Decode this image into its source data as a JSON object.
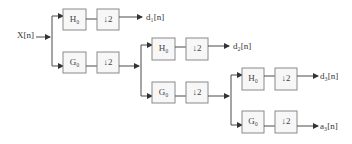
{
  "diagram": {
    "type": "three-level wavelet decomposition filter bank",
    "input": {
      "label": "X[n]"
    },
    "stages": [
      {
        "high": {
          "filter": "H₀",
          "downsample": "↓2",
          "output": "d₁[n]"
        },
        "low": {
          "filter": "G₀",
          "downsample": "↓2"
        }
      },
      {
        "high": {
          "filter": "H₀",
          "downsample": "↓2",
          "output": "d₂[n]"
        },
        "low": {
          "filter": "G₀",
          "downsample": "↓2"
        }
      },
      {
        "high": {
          "filter": "H₀",
          "downsample": "↓2",
          "output": "d₃[n]"
        },
        "low": {
          "filter": "G₀",
          "downsample": "↓2",
          "output": "a₃[n]"
        }
      }
    ],
    "colors": {
      "line": "#4a4a4a",
      "box_border": "#8a8a8a",
      "box_fill": "#f7f7f7",
      "background": "#ffffff"
    }
  }
}
